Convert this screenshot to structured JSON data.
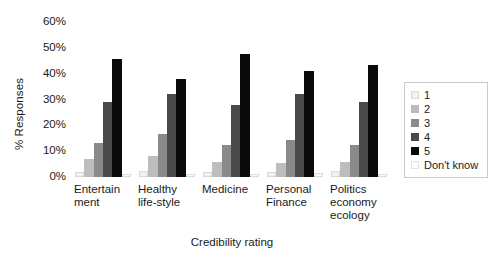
{
  "chart_data": {
    "type": "bar",
    "title": "",
    "xlabel": "Credibility rating",
    "ylabel": "% Responses",
    "ylim": [
      0,
      60
    ],
    "ytick_labels": [
      "60%",
      "50%",
      "40%",
      "30%",
      "20%",
      "10%",
      "0%"
    ],
    "ytick_values": [
      60,
      50,
      40,
      30,
      20,
      10,
      0
    ],
    "grid": false,
    "legend_position": "right",
    "categories": [
      "Entertain\nment",
      "Healthy\nlife-style",
      "Medicine",
      "Personal\nFinance",
      "Politics\neconomy\necology"
    ],
    "series": [
      {
        "name": "1",
        "color": "#f2f2f2",
        "values": [
          2.0,
          2.5,
          2.0,
          2.0,
          2.5
        ]
      },
      {
        "name": "2",
        "color": "#bdbdbd",
        "values": [
          7.0,
          8.0,
          6.0,
          5.5,
          6.0
        ]
      },
      {
        "name": "3",
        "color": "#8a8a8a",
        "values": [
          13.0,
          16.5,
          12.5,
          14.5,
          12.5
        ]
      },
      {
        "name": "4",
        "color": "#4a4a4a",
        "values": [
          29.0,
          32.0,
          28.0,
          32.0,
          29.0
        ]
      },
      {
        "name": "5",
        "color": "#0a0a0a",
        "values": [
          45.5,
          38.0,
          47.5,
          41.0,
          43.5
        ]
      },
      {
        "name": "Don't know",
        "color": "#fdfdfd",
        "values": [
          1.0,
          1.0,
          1.0,
          1.5,
          1.0
        ]
      }
    ]
  },
  "legend": {
    "entries": [
      {
        "label": "1"
      },
      {
        "label": "2"
      },
      {
        "label": "3"
      },
      {
        "label": "4"
      },
      {
        "label": "5"
      },
      {
        "label": "Don't know"
      }
    ]
  }
}
